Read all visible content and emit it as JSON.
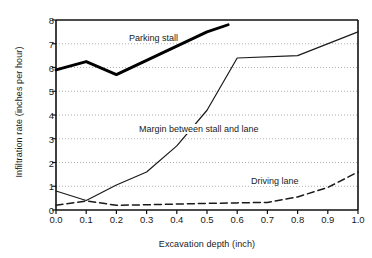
{
  "chart_data": {
    "type": "line",
    "title": "",
    "xlabel": "Excavation depth (inch)",
    "ylabel": "Infiltration rate (inches per hour)",
    "xlim": [
      0.0,
      1.0
    ],
    "ylim": [
      0,
      8
    ],
    "xticks": [
      "0.0",
      "0.1",
      "0.2",
      "0.3",
      "0.4",
      "0.5",
      "0.6",
      "0.7",
      "0.8",
      "0.9",
      "1.0"
    ],
    "yticks": [
      "0",
      "1",
      "2",
      "3",
      "4",
      "5",
      "6",
      "7",
      "8"
    ],
    "grid": "horizontal-dotted",
    "legend": "inline-annotations",
    "series": [
      {
        "name": "Parking stall",
        "style": "thick-solid",
        "color": "#000000",
        "x": [
          0.0,
          0.1,
          0.2,
          0.4,
          0.5,
          0.57
        ],
        "values": [
          5.9,
          6.25,
          5.7,
          6.9,
          7.5,
          7.8
        ]
      },
      {
        "name": "Margin between stall and lane",
        "style": "thin-solid",
        "color": "#1a1a1a",
        "x": [
          0.0,
          0.1,
          0.2,
          0.3,
          0.4,
          0.5,
          0.6,
          0.8,
          1.0
        ],
        "values": [
          0.8,
          0.4,
          1.05,
          1.6,
          2.7,
          4.2,
          6.4,
          6.5,
          7.5
        ]
      },
      {
        "name": "Driving lane",
        "style": "dashed",
        "color": "#1a1a1a",
        "x": [
          0.0,
          0.1,
          0.2,
          0.3,
          0.4,
          0.5,
          0.6,
          0.7,
          0.8,
          0.9,
          1.0
        ],
        "values": [
          0.2,
          0.38,
          0.2,
          0.22,
          0.25,
          0.28,
          0.3,
          0.32,
          0.55,
          0.95,
          1.6
        ]
      }
    ],
    "annotations": [
      {
        "text": "Parking stall",
        "series": "Parking stall"
      },
      {
        "text": "Margin between stall and lane",
        "series": "Margin between stall and lane"
      },
      {
        "text": "Driving lane",
        "series": "Driving lane"
      }
    ]
  }
}
